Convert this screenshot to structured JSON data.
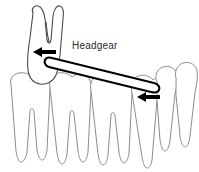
{
  "diagram": {
    "title": "Headgear orthodontic appliance diagram",
    "label": "Headgear",
    "colors": {
      "background": "#ffffff",
      "light_outline": "#8d8d8d",
      "dark_outline": "#4a4a4a",
      "appliance": "#000000",
      "arrow": "#000000",
      "text": "#2b2b2b"
    },
    "upper_arch": {
      "name": "upper-molar",
      "description": "Upper first molar tilted distally with two visible roots pointing up",
      "count": 1
    },
    "lower_arch": {
      "name": "lower-teeth-row",
      "description": "Row of lower teeth drawn in light gray outline",
      "count": 4
    },
    "right_teeth": {
      "name": "right-teeth-group",
      "description": "Group of anterior teeth on the right side",
      "count": 3
    },
    "appliance": {
      "name": "headgear-bar",
      "description": "Elongated facebow rod running from upper left molar down to the right anterior tooth"
    },
    "arrows": [
      {
        "name": "force-arrow-upper",
        "direction": "left",
        "description": "Distalizing force on upper molar"
      },
      {
        "name": "force-arrow-right",
        "direction": "left",
        "description": "Force applied at right anterior tooth"
      }
    ]
  }
}
